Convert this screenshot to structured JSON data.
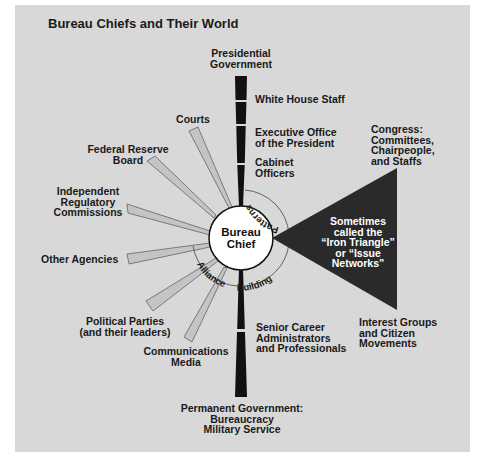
{
  "title": "Bureau Chiefs and Their World",
  "colors": {
    "panel_background": "#d8d8d8",
    "page_background": "#ffffff",
    "bar_fill": "#111111",
    "triangle_fill": "#2a2a2a",
    "wedge_fill": "#c4c4c4",
    "circle_fill": "#ffffff",
    "text": "#1a1a1a"
  },
  "center": {
    "label": "Bureau\nChief"
  },
  "presidential_government": {
    "heading": "Presidential\nGovernment",
    "items": [
      "White House Staff",
      "Executive Office\nof the President",
      "Cabinet\nOfficers"
    ]
  },
  "permanent_government": {
    "heading": "Permanent Government:\nBureaucracy\nMilitary Service",
    "items": [
      "Senior Career\nAdministrators\nand Professionals"
    ]
  },
  "iron_triangle": {
    "top_label": "Congress:\nCommittees,\nChairpeople,\nand Staffs",
    "bottom_label": "Interest Groups\nand Citizen\nMovements",
    "inner_text": "Sometimes\ncalled the\n“Iron Triangle”\nor “Issue\nNetworks”"
  },
  "spokes": [
    {
      "label": "Courts"
    },
    {
      "label": "Federal Reserve\nBoard"
    },
    {
      "label": "Independent\nRegulatory\nCommissions"
    },
    {
      "label": "Other Agencies"
    },
    {
      "label": "Political Parties\n(and their leaders)"
    },
    {
      "label": "Communications\nMedia"
    }
  ],
  "arc_labels": {
    "patterns": "Patterns",
    "building": "Building",
    "alliance": "Alliance"
  }
}
